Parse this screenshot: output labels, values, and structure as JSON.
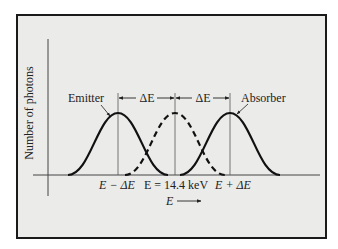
{
  "figure": {
    "y_axis_label": "Number of photons",
    "x_axis_label": "E",
    "emitter_label": "Emitter",
    "absorber_label": "Absorber",
    "delta_left_label": "ΔE",
    "delta_right_label": "ΔE",
    "tick_left_label": "E − ΔE",
    "tick_center_label": "E = 14.4 keV",
    "tick_right_label": "E + ΔE"
  },
  "curves": [
    {
      "name": "Emitter",
      "center_label": "E − ΔE",
      "style": "solid"
    },
    {
      "name": "Reference",
      "center_label": "E = 14.4 keV",
      "style": "dashed"
    },
    {
      "name": "Absorber",
      "center_label": "E + ΔE",
      "style": "solid"
    }
  ],
  "colors": {
    "background": "#ebebea",
    "ink": "#1a1a1a"
  }
}
